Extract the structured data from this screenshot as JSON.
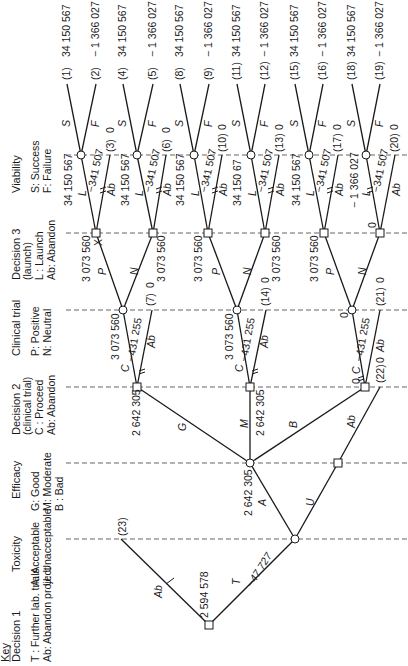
{
  "key": {
    "title": "Key",
    "stages": [
      {
        "id": "decision1",
        "title": "Decision 1",
        "title2": "",
        "legend": [
          "T : Further lab. trials",
          "Ab: Abandon project"
        ]
      },
      {
        "id": "toxicity",
        "title": "Toxicity",
        "title2": "",
        "legend": [
          "A: Acceptable",
          "U: Unacceptable"
        ]
      },
      {
        "id": "efficacy",
        "title": "Efficacy",
        "title2": "",
        "legend": [
          "G: Good",
          "M: Moderate",
          "B : Bad"
        ]
      },
      {
        "id": "decision2",
        "title": "Decision 2",
        "title2": "(clinical trial)",
        "legend": [
          "C : Proceed",
          "Ab: Abandon"
        ]
      },
      {
        "id": "clinical",
        "title": "Clinical trial",
        "title2": "",
        "legend": [
          "P: Positive",
          "N: Neutral"
        ]
      },
      {
        "id": "decision3",
        "title": "Decision 3",
        "title2": "(launch)",
        "legend": [
          "L : Launch",
          "Ab: Abandon"
        ]
      },
      {
        "id": "viability",
        "title": "Viability",
        "title2": "",
        "legend": [
          "S: Success",
          "F: Failure"
        ]
      }
    ]
  },
  "outcomes": [
    {
      "id": "(1)",
      "value": "34 150 567"
    },
    {
      "id": "(2)",
      "value": "− 1 366 027"
    },
    {
      "id": "(3)",
      "value": "0"
    },
    {
      "id": "(4)",
      "value": "34 150 567"
    },
    {
      "id": "(5)",
      "value": "− 1 366 027"
    },
    {
      "id": "(6)",
      "value": "0"
    },
    {
      "id": "(7)",
      "value": "0"
    },
    {
      "id": "(8)",
      "value": "34 150 567"
    },
    {
      "id": "(9)",
      "value": "− 1 366 027"
    },
    {
      "id": "(10)",
      "value": "0"
    },
    {
      "id": "(11)",
      "value": "34 150 567"
    },
    {
      "id": "(12)",
      "value": "− 1 366 027"
    },
    {
      "id": "(13)",
      "value": "0"
    },
    {
      "id": "(14)",
      "value": "0"
    },
    {
      "id": "(15)",
      "value": "34 150 567"
    },
    {
      "id": "(16)",
      "value": "− 1 366 027"
    },
    {
      "id": "(17)",
      "value": "0"
    },
    {
      "id": "(18)",
      "value": "34 150 567"
    },
    {
      "id": "(19)",
      "value": "− 1 366 027"
    },
    {
      "id": "(20)",
      "value": "0"
    },
    {
      "id": "(21)",
      "value": "0"
    },
    {
      "id": "(22)",
      "value": "0"
    },
    {
      "id": "(23)",
      "value": ""
    }
  ],
  "node_values": {
    "d1": "2 594 578",
    "t_cost": "−47 727",
    "tox": "2 642 305",
    "eff_g": "2 642 305",
    "eff_m": "2 642 305",
    "d2_cost": "−431 255",
    "d2_good": "3 073 560",
    "d2_mod": "3 073 560",
    "d2_bad": "0",
    "d2_bad_sq": "0",
    "ct_p1": "3 073 560",
    "ct_n1": "3 073 560",
    "ct_p2": "3 073 560",
    "ct_n2": "3 073 560",
    "ct_p3": "3 073 560",
    "ct_n3": "0",
    "d3_cost": "−341 507",
    "v1": "34 150 567",
    "v2": "34 150 567",
    "v3": "34 150 567",
    "v4": "34 150 67",
    "v5": "34 150 567",
    "v6": "− 1 366 027",
    "x_mark": "X"
  },
  "branch_labels": {
    "T": "T",
    "Ab": "Ab",
    "A": "A",
    "U": "U",
    "G": "G",
    "M": "M",
    "B": "B",
    "C": "C",
    "P": "P",
    "N": "N",
    "L": "L",
    "S": "S",
    "F": "F"
  }
}
